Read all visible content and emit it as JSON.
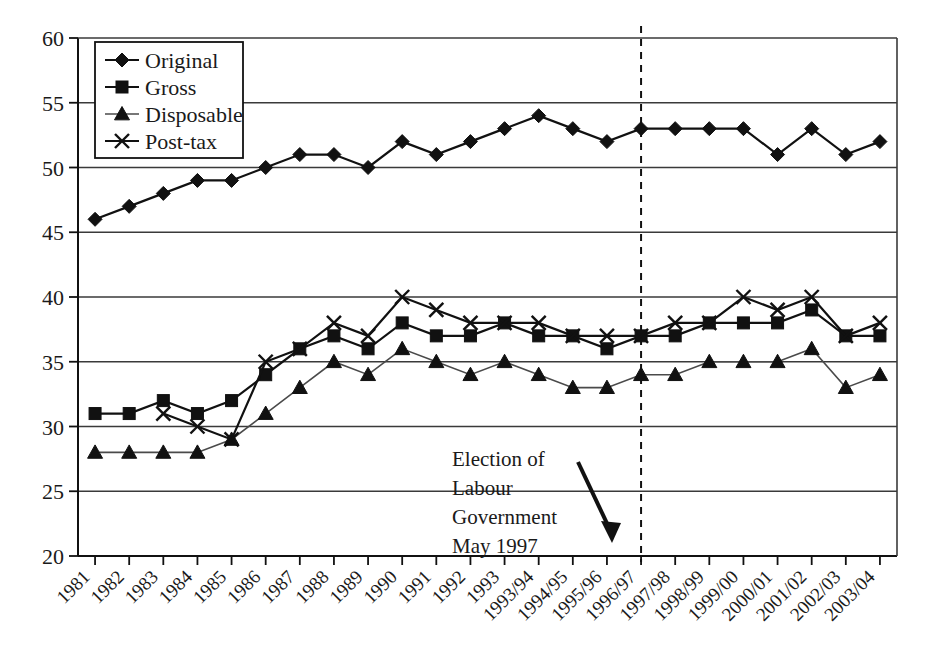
{
  "chart_data": {
    "type": "line",
    "title": "",
    "xlabel": "",
    "ylabel": "",
    "ylim": [
      20,
      60
    ],
    "yticks": [
      20,
      25,
      30,
      35,
      40,
      45,
      50,
      55,
      60
    ],
    "grid": true,
    "legend_position": "top-left",
    "categories": [
      "1981",
      "1982",
      "1983",
      "1984",
      "1985",
      "1986",
      "1987",
      "1988",
      "1989",
      "1990",
      "1991",
      "1992",
      "1993",
      "1993/94",
      "1994/95",
      "1995/96",
      "1996/97",
      "1997/98",
      "1998/99",
      "1999/00",
      "2000/01",
      "2001/02",
      "2002/03",
      "2003/04"
    ],
    "series": [
      {
        "name": "Original",
        "marker": "diamond",
        "values": [
          46,
          47,
          48,
          49,
          49,
          50,
          51,
          51,
          50,
          52,
          51,
          52,
          53,
          54,
          53,
          52,
          53,
          53,
          53,
          53,
          51,
          53,
          51,
          52
        ]
      },
      {
        "name": "Gross",
        "marker": "square",
        "values": [
          31,
          31,
          32,
          31,
          32,
          34,
          36,
          37,
          36,
          38,
          37,
          37,
          38,
          37,
          37,
          36,
          37,
          37,
          38,
          38,
          38,
          39,
          37,
          37
        ]
      },
      {
        "name": "Disposable",
        "marker": "triangle",
        "values": [
          28,
          28,
          28,
          28,
          29,
          31,
          33,
          35,
          34,
          36,
          35,
          34,
          35,
          34,
          33,
          33,
          34,
          34,
          35,
          35,
          35,
          36,
          33,
          34
        ]
      },
      {
        "name": "Post-tax",
        "marker": "cross",
        "values": [
          null,
          null,
          31,
          30,
          29,
          35,
          36,
          38,
          37,
          40,
          39,
          38,
          38,
          38,
          37,
          37,
          37,
          38,
          38,
          40,
          39,
          40,
          37,
          38
        ]
      }
    ],
    "annotations": [
      {
        "name": "election-annotation",
        "lines": [
          "Election of",
          "Labour",
          "Government",
          "May 1997"
        ],
        "arrow": "down-right",
        "target_category": "1996/97"
      }
    ],
    "event_marker": {
      "name": "election-line",
      "style": "dashed-vertical",
      "at_category": "1996/97"
    }
  },
  "legend": {
    "items": [
      {
        "label": "Original",
        "marker": "diamond"
      },
      {
        "label": "Gross",
        "marker": "square"
      },
      {
        "label": "Disposable",
        "marker": "triangle"
      },
      {
        "label": "Post-tax",
        "marker": "cross"
      }
    ]
  },
  "colors": {
    "ink": "#111111",
    "grid": "#3a3a3a",
    "faint": "#4a4a4a",
    "background": "#ffffff"
  }
}
